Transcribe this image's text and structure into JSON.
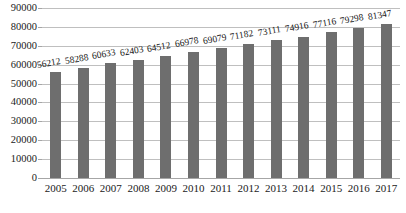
{
  "chart_data": {
    "type": "bar",
    "title": "",
    "subtitle": "",
    "xlabel": "",
    "ylabel": "",
    "categories": [
      "2005",
      "2006",
      "2007",
      "2008",
      "2009",
      "2010",
      "2011",
      "2012",
      "2013",
      "2014",
      "2015",
      "2016",
      "2017"
    ],
    "values": [
      56212,
      58288,
      60633,
      62403,
      64512,
      66978,
      69079,
      71182,
      73111,
      74916,
      77116,
      79298,
      81347
    ],
    "data_labels": [
      "56212",
      "58288",
      "60633",
      "62403",
      "64512",
      "66978",
      "69079",
      "71182",
      "73111",
      "74916",
      "77116",
      "79298",
      "81347"
    ],
    "ylim": [
      0,
      90000
    ],
    "ytick_values": [
      0,
      10000,
      20000,
      30000,
      40000,
      50000,
      60000,
      70000,
      80000,
      90000
    ],
    "ytick_labels": [
      "0",
      "10000",
      "20000",
      "30000",
      "40000",
      "50000",
      "60000",
      "70000",
      "80000",
      "90000"
    ],
    "grid": true,
    "legend": false,
    "legend_position": "none",
    "series_color": "#6e6e6e",
    "gridline_color": "#bfbfbf",
    "axis_color": "#a6a6a6",
    "text_color": "#1a1a1a",
    "data_label_rotation_deg": -10
  }
}
